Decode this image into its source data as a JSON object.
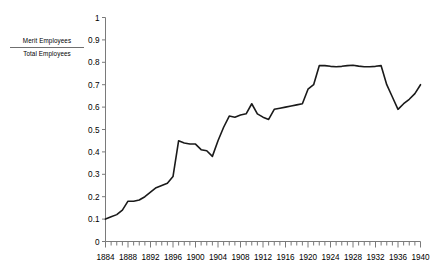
{
  "chart_data": {
    "type": "line",
    "title": "",
    "subtitle": "",
    "xlabel": "",
    "ylabel": "",
    "legend": {
      "position": "left-outside",
      "numerator": "Merit Employees",
      "denominator": "Total Employees",
      "entries": [
        "Merit Employees / Total Employees"
      ]
    },
    "grid": false,
    "series_color": "#1a1a1a",
    "axis_color": "#7a7a7a",
    "xlim": [
      1884,
      1940
    ],
    "ylim": [
      0,
      1
    ],
    "ytick_labels": [
      "1",
      "0.9",
      "0.8",
      "0.7",
      "0.6",
      "0.5",
      "0.4",
      "0.3",
      "0.2",
      "0.1",
      "0"
    ],
    "ytick_values": [
      1,
      0.9,
      0.8,
      0.7,
      0.6,
      0.5,
      0.4,
      0.3,
      0.2,
      0.1,
      0
    ],
    "xtick_labels": [
      "1884",
      "1888",
      "1892",
      "1896",
      "1900",
      "1904",
      "1908",
      "1912",
      "1916",
      "1920",
      "1924",
      "1928",
      "1932",
      "1936",
      "1940"
    ],
    "xtick_values": [
      1884,
      1888,
      1892,
      1896,
      1900,
      1904,
      1908,
      1912,
      1916,
      1920,
      1924,
      1928,
      1932,
      1936,
      1940
    ],
    "minor_xtick_interval": 1,
    "x": [
      1884,
      1885,
      1886,
      1887,
      1888,
      1889,
      1890,
      1891,
      1892,
      1893,
      1894,
      1895,
      1896,
      1897,
      1898,
      1899,
      1900,
      1901,
      1902,
      1903,
      1904,
      1905,
      1906,
      1907,
      1908,
      1909,
      1910,
      1911,
      1912,
      1913,
      1914,
      1915,
      1916,
      1917,
      1918,
      1919,
      1920,
      1921,
      1922,
      1923,
      1924,
      1925,
      1926,
      1927,
      1928,
      1929,
      1930,
      1931,
      1932,
      1933,
      1934,
      1935,
      1936,
      1937,
      1938,
      1939,
      1940
    ],
    "values": [
      0.1,
      0.11,
      0.12,
      0.14,
      0.18,
      0.18,
      0.185,
      0.2,
      0.22,
      0.24,
      0.25,
      0.26,
      0.29,
      0.45,
      0.44,
      0.435,
      0.435,
      0.41,
      0.405,
      0.38,
      0.45,
      0.51,
      0.56,
      0.555,
      0.565,
      0.57,
      0.615,
      0.57,
      0.555,
      0.545,
      0.59,
      0.595,
      0.6,
      0.605,
      0.61,
      0.615,
      0.68,
      0.7,
      0.785,
      0.785,
      0.782,
      0.78,
      0.782,
      0.785,
      0.787,
      0.783,
      0.78,
      0.78,
      0.782,
      0.785,
      0.7,
      0.645,
      0.59,
      0.615,
      0.635,
      0.66,
      0.7
    ]
  }
}
